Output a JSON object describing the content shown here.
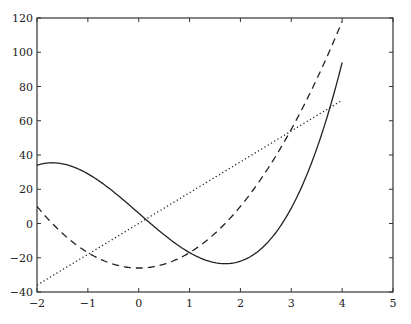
{
  "chart_data": {
    "type": "line",
    "title": "",
    "xlabel": "",
    "ylabel": "",
    "xlim": [
      -2,
      5
    ],
    "ylim": [
      -40,
      120
    ],
    "grid": false,
    "legend": null,
    "x_ticks": [
      -2,
      -1,
      0,
      1,
      2,
      3,
      4,
      5
    ],
    "y_ticks": [
      -40,
      -20,
      0,
      20,
      40,
      60,
      80,
      100,
      120
    ],
    "x_tick_labels": [
      "−2",
      "−1",
      "0",
      "1",
      "2",
      "3",
      "4",
      "5"
    ],
    "y_tick_labels": [
      "−40",
      "−20",
      "0",
      "20",
      "40",
      "60",
      "80",
      "100",
      "120"
    ],
    "x": [
      -2.0,
      -1.5,
      -1.0,
      -0.5,
      0.0,
      0.5,
      1.0,
      1.5,
      2.0,
      2.5,
      3.0,
      3.5,
      4.0
    ],
    "series": [
      {
        "name": "f(x) ≈ 3x³ − 26x + 6",
        "style": "solid",
        "values": [
          34,
          34.9,
          29,
          18.6,
          6,
          -6.6,
          -17,
          -22.9,
          -22,
          -12.1,
          9,
          46.6,
          94
        ]
      },
      {
        "name": "f'(x) ≈ 9x² − 26",
        "style": "dashed",
        "values": [
          10,
          -5.75,
          -17,
          -23.75,
          -26,
          -23.75,
          -17,
          -5.75,
          10,
          30.25,
          55,
          84.25,
          118
        ]
      },
      {
        "name": "f''(x) ≈ 18x",
        "style": "dotted",
        "values": [
          -36,
          -27,
          -18,
          -9,
          0,
          9,
          18,
          27,
          36,
          45,
          54,
          63,
          72
        ]
      }
    ],
    "functions": {
      "solid": {
        "a3": 3,
        "a2": 0,
        "a1": -26,
        "a0": 6,
        "x_range": [
          -2,
          4
        ]
      },
      "dashed": {
        "a3": 0,
        "a2": 9,
        "a1": 0,
        "a0": -26,
        "x_range": [
          -2,
          4
        ]
      },
      "dotted": {
        "a3": 0,
        "a2": 0,
        "a1": 18,
        "a0": 0,
        "x_range": [
          -2,
          4
        ]
      }
    },
    "colors": {
      "line": "#222222",
      "axis": "#333333",
      "background": "#ffffff"
    }
  },
  "layout": {
    "plot_left": 37,
    "plot_top": 18,
    "plot_right": 393,
    "plot_bottom": 292
  }
}
